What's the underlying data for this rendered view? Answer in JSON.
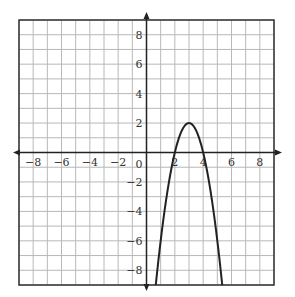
{
  "chart_data": {
    "type": "line",
    "title": "",
    "xlabel": "",
    "ylabel": "",
    "xlim": [
      -9,
      9
    ],
    "ylim": [
      -9,
      9
    ],
    "grid": true,
    "grid_step": 1,
    "x_ticks": [
      -8,
      -6,
      -4,
      -2,
      2,
      4,
      6,
      8
    ],
    "y_ticks": [
      8,
      6,
      4,
      2,
      -2,
      -4,
      -6,
      -8
    ],
    "x_tick_labels": [
      "−8",
      "−6",
      "−4",
      "−2",
      "2",
      "4",
      "6",
      "8"
    ],
    "y_tick_labels": [
      "8",
      "6",
      "4",
      "2",
      "−2",
      "−4",
      "−6",
      "−8"
    ],
    "origin_label": "0",
    "legend": [],
    "series": [
      {
        "name": "parabola",
        "equation": "y = -2(x-3)^2 + 2",
        "vertex": [
          3,
          2
        ],
        "x_intercepts": [
          2,
          4
        ],
        "x": [
          0.65,
          1,
          1.5,
          2,
          2.5,
          3,
          3.5,
          4,
          4.5,
          5,
          5.35
        ],
        "values": [
          -9,
          -6,
          -2.5,
          0,
          1.5,
          2,
          1.5,
          0,
          -2.5,
          -6,
          -9
        ]
      }
    ]
  },
  "colors": {
    "grid": "#b8b8b8",
    "axis": "#222222",
    "curve": "#222222",
    "border": "#333333",
    "background": "#ffffff"
  }
}
